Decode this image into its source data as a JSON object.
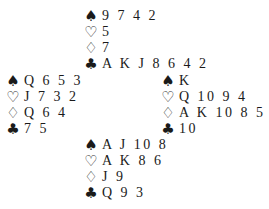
{
  "suits": {
    "spades": "♠",
    "hearts": "♡",
    "diamonds": "♢",
    "clubs": "♣"
  },
  "deal": {
    "north": {
      "spades": "9 7 4 2",
      "hearts": "5",
      "diamonds": "7",
      "clubs": "A K J 8 6 4 2"
    },
    "west": {
      "spades": "Q 6 5 3",
      "hearts": "J 7 3 2",
      "diamonds": "Q 6 4",
      "clubs": "7 5"
    },
    "east": {
      "spades": "K",
      "hearts": "Q 10 9 4",
      "diamonds": "A K 10 8 5 3 2",
      "clubs": "10"
    },
    "south": {
      "spades": "A J 10 8",
      "hearts": "A K 8 6",
      "diamonds": "J 9",
      "clubs": "Q 9 3"
    }
  }
}
